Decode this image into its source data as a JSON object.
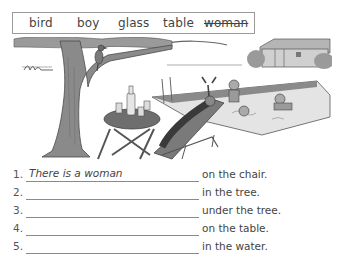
{
  "word_box": {
    "words": [
      {
        "text": "bird",
        "struck": false
      },
      {
        "text": "boy",
        "struck": false
      },
      {
        "text": "glass",
        "struck": false
      },
      {
        "text": "table",
        "struck": false
      },
      {
        "text": "woman",
        "struck": true
      }
    ]
  },
  "illustration": {
    "description": "Garden scene: tree with a bird on a branch, round table with a bottle and glasses, woman lying on a deckchair, children splashing in a pool, house in the background",
    "fill_gray": "#8c8c8c",
    "dark_gray": "#5a5a5a",
    "light_gray": "#c8c8c8"
  },
  "sentences": [
    {
      "number": "1.",
      "answer": "There is a woman",
      "ending": "on the chair."
    },
    {
      "number": "2.",
      "answer": "",
      "ending": "in the tree."
    },
    {
      "number": "3.",
      "answer": "",
      "ending": "under the tree."
    },
    {
      "number": "4.",
      "answer": "",
      "ending": "on the table."
    },
    {
      "number": "5.",
      "answer": "",
      "ending": "in the water."
    }
  ]
}
